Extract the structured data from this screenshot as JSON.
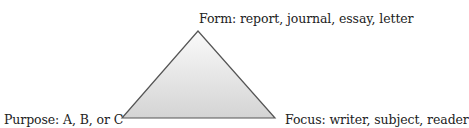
{
  "diagram": {
    "type": "triangle",
    "vertices": {
      "top": {
        "label": "Form: report, journal, essay, letter"
      },
      "bottom_left": {
        "label": "Purpose: A, B, or C"
      },
      "bottom_right": {
        "label": "Focus: writer, subject, reader"
      }
    },
    "colors": {
      "stroke": "#555555",
      "fill_top": "#fafafa",
      "fill_bottom": "#d6d6d6"
    }
  }
}
